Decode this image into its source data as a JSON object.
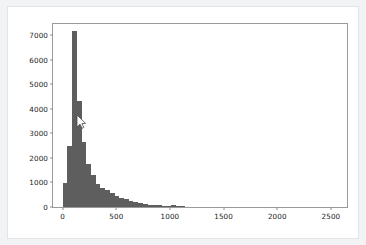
{
  "window": {
    "background_color": "#f2f3f4",
    "card_background": "#ffffff",
    "card_border_color": "#e3e4e6"
  },
  "cursor": {
    "name": "mouse-pointer",
    "x": 78,
    "y": 118
  },
  "chart_data": {
    "type": "bar",
    "subtype": "histogram",
    "title": "",
    "xlabel": "",
    "ylabel": "",
    "xlim": [
      -90,
      2650
    ],
    "ylim": [
      0,
      7450
    ],
    "grid": false,
    "legend": false,
    "bar_color": "#5e5e5e",
    "spine_color": "#9a9a9a",
    "tick_label_color": "#1c1c1c",
    "xticks": [
      0,
      500,
      1000,
      1500,
      2000,
      2500
    ],
    "xtick_labels": [
      "0",
      "500",
      "1000",
      "1500",
      "2000",
      "2500"
    ],
    "yticks": [
      0,
      1000,
      2000,
      3000,
      4000,
      5000,
      6000,
      7000
    ],
    "ytick_labels": [
      "0",
      "1000",
      "2000",
      "3000",
      "4000",
      "5000",
      "6000",
      "7000"
    ],
    "bin_width": 44,
    "bin_starts": [
      0,
      44,
      88,
      132,
      176,
      220,
      264,
      308,
      352,
      396,
      440,
      484,
      528,
      572,
      616,
      660,
      704,
      748,
      792,
      836,
      880,
      924,
      968,
      1012,
      1056,
      1100
    ],
    "values": [
      980,
      2470,
      7180,
      4330,
      2630,
      1760,
      1310,
      930,
      760,
      690,
      560,
      450,
      370,
      310,
      250,
      200,
      160,
      130,
      100,
      80,
      65,
      50,
      60,
      80,
      30,
      10
    ]
  }
}
